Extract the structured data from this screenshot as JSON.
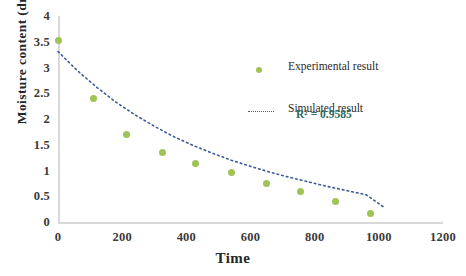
{
  "chart_data": {
    "type": "scatter",
    "title": "",
    "xlabel": "Time",
    "ylabel": "Moisture content (dry bais)",
    "xlim": [
      0,
      1200
    ],
    "ylim": [
      0,
      4
    ],
    "xticks": [
      0,
      200,
      400,
      600,
      800,
      1000,
      1200
    ],
    "xtick_labels": [
      "0",
      "200",
      "400",
      "600",
      "800",
      "1000",
      "1200"
    ],
    "yticks": [
      0,
      0.5,
      1,
      1.5,
      2,
      2.5,
      3,
      3.5,
      4
    ],
    "ytick_labels": [
      "0",
      "0.5",
      "1",
      "1.5",
      "2",
      "2.5",
      "3",
      "3.5",
      "4"
    ],
    "grid": false,
    "legend_position": "center-right",
    "series": [
      {
        "name": "Experimental result",
        "marker": "circle",
        "color": "#9fc355",
        "points": [
          {
            "x": 0,
            "y": 3.53
          },
          {
            "x": 110,
            "y": 2.39
          },
          {
            "x": 215,
            "y": 1.7
          },
          {
            "x": 325,
            "y": 1.34
          },
          {
            "x": 430,
            "y": 1.14
          },
          {
            "x": 540,
            "y": 0.96
          },
          {
            "x": 650,
            "y": 0.75
          },
          {
            "x": 757,
            "y": 0.6
          },
          {
            "x": 865,
            "y": 0.39
          },
          {
            "x": 975,
            "y": 0.17
          }
        ]
      },
      {
        "name": "Simulated result",
        "marker": "dotted-line",
        "color": "#3a5a9b",
        "points": [
          {
            "x": 0,
            "y": 3.31
          },
          {
            "x": 60,
            "y": 2.94
          },
          {
            "x": 120,
            "y": 2.62
          },
          {
            "x": 180,
            "y": 2.33
          },
          {
            "x": 240,
            "y": 2.08
          },
          {
            "x": 300,
            "y": 1.86
          },
          {
            "x": 360,
            "y": 1.66
          },
          {
            "x": 420,
            "y": 1.49
          },
          {
            "x": 480,
            "y": 1.34
          },
          {
            "x": 540,
            "y": 1.2
          },
          {
            "x": 600,
            "y": 1.08
          },
          {
            "x": 660,
            "y": 0.97
          },
          {
            "x": 720,
            "y": 0.87
          },
          {
            "x": 780,
            "y": 0.78
          },
          {
            "x": 840,
            "y": 0.69
          },
          {
            "x": 900,
            "y": 0.61
          },
          {
            "x": 960,
            "y": 0.53
          },
          {
            "x": 1020,
            "y": 0.27
          }
        ]
      }
    ],
    "annotations": [
      {
        "name": "r-squared",
        "text": "R² = 0.9585",
        "color": "#2e6b5e"
      }
    ]
  },
  "legend": {
    "items": [
      {
        "label": "Experimental result",
        "marker": "dot",
        "color": "#9fc355"
      },
      {
        "label": "Simulated  result",
        "marker": "dotted",
        "color": "#3a5a9b"
      }
    ],
    "r_squared": "R² = 0.9585"
  },
  "axes": {
    "x_title": "Time",
    "y_title": "Moisture content (dry bais)"
  }
}
